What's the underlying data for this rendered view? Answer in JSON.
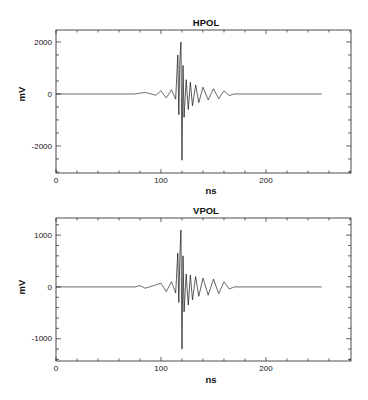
{
  "chart_data": [
    {
      "type": "line",
      "title": "HPOL",
      "xlabel": "ns",
      "ylabel": "mV",
      "xlim": [
        0,
        281
      ],
      "ylim": [
        -3040,
        2460
      ],
      "x_ticks": [
        0,
        100,
        200
      ],
      "y_ticks": [
        -2000,
        0,
        2000
      ],
      "x_minor_step": 20,
      "y_minor_step": 500,
      "grid": false,
      "trace_end_ns": 253,
      "series": [
        {
          "name": "HPOL",
          "x": [
            0,
            75,
            85,
            95,
            100,
            105,
            110,
            114,
            116,
            117,
            118,
            119,
            120,
            121,
            122,
            124,
            126,
            128,
            130,
            133,
            136,
            140,
            145,
            150,
            155,
            160,
            165,
            170,
            200,
            253
          ],
          "values": [
            0,
            0,
            60,
            -50,
            120,
            -150,
            160,
            -200,
            1500,
            -800,
            1300,
            2000,
            -2550,
            1100,
            -900,
            550,
            -600,
            450,
            -450,
            350,
            -330,
            260,
            -230,
            200,
            -180,
            120,
            -60,
            0,
            0,
            0
          ]
        }
      ]
    },
    {
      "type": "line",
      "title": "VPOL",
      "xlabel": "ns",
      "ylabel": "mV",
      "xlim": [
        0,
        281
      ],
      "ylim": [
        -1430,
        1330
      ],
      "x_ticks": [
        0,
        100,
        200
      ],
      "y_ticks": [
        -1000,
        0,
        1000
      ],
      "x_minor_step": 20,
      "y_minor_step": 200,
      "grid": false,
      "trace_end_ns": 253,
      "series": [
        {
          "name": "VPOL",
          "x": [
            0,
            75,
            80,
            85,
            100,
            105,
            110,
            114,
            116,
            117,
            118,
            119,
            120,
            121,
            122,
            124,
            126,
            128,
            130,
            133,
            136,
            140,
            145,
            150,
            155,
            160,
            165,
            170,
            200,
            253
          ],
          "values": [
            0,
            0,
            25,
            -25,
            70,
            -90,
            100,
            -120,
            650,
            -300,
            600,
            1100,
            -1200,
            600,
            -480,
            250,
            -350,
            230,
            -250,
            200,
            -180,
            170,
            -160,
            150,
            -130,
            100,
            -40,
            0,
            0,
            0
          ]
        }
      ]
    }
  ],
  "plots": [
    {
      "title": "HPOL",
      "xlabel": "ns",
      "ylabel": "mV",
      "xtick_labels": [
        "0",
        "100",
        "200"
      ],
      "ytick_labels": [
        "2000",
        "0",
        "-2000"
      ]
    },
    {
      "title": "VPOL",
      "xlabel": "ns",
      "ylabel": "mV",
      "xtick_labels": [
        "0",
        "100",
        "200"
      ],
      "ytick_labels": [
        "1000",
        "0",
        "-1000"
      ]
    }
  ],
  "colors": {
    "trace": "#111111",
    "axes": "#222222",
    "background": "#ffffff"
  }
}
